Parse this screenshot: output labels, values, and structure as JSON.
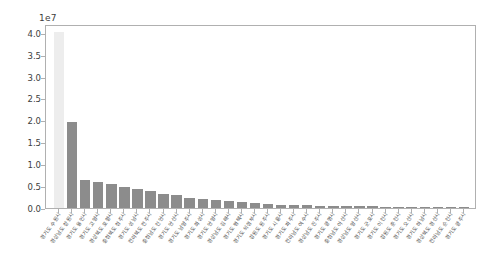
{
  "figure": {
    "background_color": "#ffffff",
    "axes_edge_color": "#b0b0b0",
    "tick_color": "#3d3d3d"
  },
  "chart_data": {
    "type": "bar",
    "title": "",
    "xlabel": "",
    "ylabel": "",
    "offset_text": "1e7",
    "y_scale_multiplier": 10000000,
    "ylim": [
      0,
      4.2
    ],
    "ytick_labels": [
      "0.0",
      "0.5",
      "1.0",
      "1.5",
      "2.0",
      "2.5",
      "3.0",
      "3.5",
      "4.0"
    ],
    "ytick_values": [
      0.0,
      0.5,
      1.0,
      1.5,
      2.0,
      2.5,
      3.0,
      3.5,
      4.0
    ],
    "grid": false,
    "legend": null,
    "bar_color": "#8c8c8c",
    "highlight_color": "#ededed",
    "highlight_index": 0,
    "categories": [
      "경기도 수원시",
      "경상남도 창원시",
      "경기도 용인시",
      "경기도 고양시",
      "경상북도 포항시",
      "충청북도 청주시",
      "경기도 성남시",
      "전라북도 전주시",
      "충청남도 천안시",
      "경기도 안산시",
      "경기도 남양주시",
      "경기도 화성시",
      "경기도 안양시",
      "경상남도 김해시",
      "경기도 평택시",
      "경기도 의정부시",
      "강원도 원주시",
      "경기도 시흥시",
      "경기도 파주시",
      "전라남도 여수시",
      "경상남도 진주시",
      "경기도 광명시",
      "충청남도 아산시",
      "경상남도 양산시",
      "경기도 군포시",
      "경기도 이천시",
      "강원도 춘천시",
      "경기도 오산시",
      "경기도 하남시",
      "경상북도 경산시",
      "전라남도 순천시",
      "경기도 광주시"
    ],
    "values": [
      4.02,
      1.97,
      0.63,
      0.6,
      0.55,
      0.49,
      0.44,
      0.38,
      0.33,
      0.29,
      0.24,
      0.2,
      0.18,
      0.15,
      0.13,
      0.11,
      0.09,
      0.08,
      0.07,
      0.06,
      0.055,
      0.05,
      0.045,
      0.04,
      0.035,
      0.03,
      0.028,
      0.025,
      0.022,
      0.02,
      0.018,
      0.015
    ]
  }
}
